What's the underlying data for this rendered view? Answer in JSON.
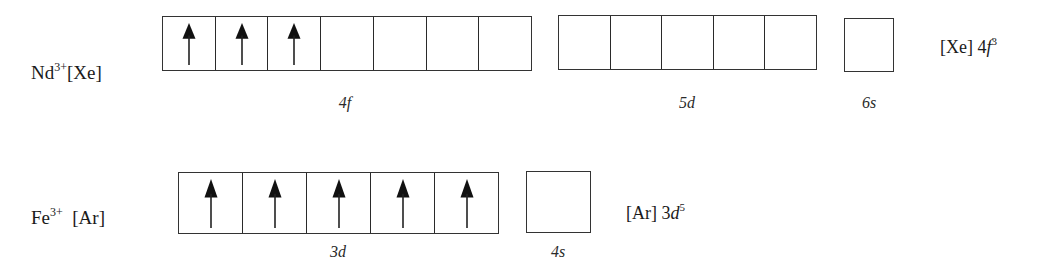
{
  "diagram": {
    "type": "orbital-box-diagram",
    "rows": [
      {
        "ion": {
          "symbol": "Nd",
          "charge": "3+",
          "core": "[Xe]"
        },
        "subshells": [
          {
            "label_num": "4",
            "label_letter": "f",
            "boxes": 7,
            "electrons": 3,
            "spins": [
              "up",
              "up",
              "up",
              "empty",
              "empty",
              "empty",
              "empty"
            ]
          },
          {
            "label_num": "5",
            "label_letter": "d",
            "boxes": 5,
            "electrons": 0,
            "spins": [
              "empty",
              "empty",
              "empty",
              "empty",
              "empty"
            ]
          },
          {
            "label_num": "6",
            "label_letter": "s",
            "boxes": 1,
            "electrons": 0,
            "spins": [
              "empty"
            ]
          }
        ],
        "configuration": {
          "core": "[Xe]",
          "num": "4",
          "letter": "f",
          "exponent": "3"
        }
      },
      {
        "ion": {
          "symbol": "Fe",
          "charge": "3+",
          "core": "[Ar]"
        },
        "subshells": [
          {
            "label_num": "3",
            "label_letter": "d",
            "boxes": 5,
            "electrons": 5,
            "spins": [
              "up",
              "up",
              "up",
              "up",
              "up"
            ]
          },
          {
            "label_num": "4",
            "label_letter": "s",
            "boxes": 1,
            "electrons": 0,
            "spins": [
              "empty"
            ]
          }
        ],
        "configuration": {
          "core": "[Ar]",
          "num": "3",
          "letter": "d",
          "exponent": "5"
        }
      }
    ],
    "colors": {
      "line": "#2a2a2a",
      "arrow": "#111111",
      "background": "#ffffff"
    }
  }
}
